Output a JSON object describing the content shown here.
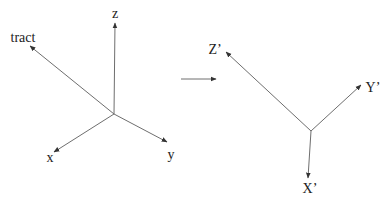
{
  "diagram": {
    "line_color": "#6e6e6e",
    "text_color": "#222222",
    "left_frame": {
      "origin": [
        114,
        114
      ],
      "axes": [
        {
          "id": "z",
          "label": "z",
          "tip": [
            115,
            23
          ],
          "label_pos": [
            115,
            14
          ]
        },
        {
          "id": "tract",
          "label": "tract",
          "tip": [
            30,
            46
          ],
          "label_pos": [
            23,
            38
          ]
        },
        {
          "id": "x",
          "label": "x",
          "tip": [
            54,
            152
          ],
          "label_pos": [
            50,
            158
          ]
        },
        {
          "id": "y",
          "label": "y",
          "tip": [
            167,
            142
          ],
          "label_pos": [
            171,
            155
          ]
        }
      ]
    },
    "transform_arrow": {
      "from": [
        181,
        79
      ],
      "to": [
        216,
        79
      ]
    },
    "right_frame": {
      "origin": [
        311,
        131
      ],
      "axes": [
        {
          "id": "z-prime",
          "label": "Z’",
          "tip": [
            226,
            52
          ],
          "label_pos": [
            215,
            50
          ]
        },
        {
          "id": "y-prime",
          "label": "Y’",
          "tip": [
            361,
            85
          ],
          "label_pos": [
            373,
            88
          ]
        },
        {
          "id": "x-prime",
          "label": "X’",
          "tip": [
            308,
            178
          ],
          "label_pos": [
            310,
            189
          ]
        }
      ]
    }
  }
}
